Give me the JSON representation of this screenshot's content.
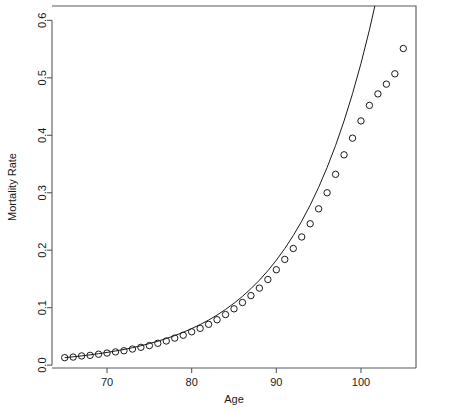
{
  "chart_data": {
    "type": "scatter",
    "title": "",
    "subtitle": "",
    "xlabel": "Age",
    "ylabel": "Mortality Rate",
    "xlim": [
      63.5,
      106.5
    ],
    "ylim": [
      -0.005,
      0.625
    ],
    "xticks": [
      70,
      80,
      90,
      100
    ],
    "xtick_labels": [
      "70",
      "80",
      "90",
      "100"
    ],
    "yticks": [
      0.0,
      0.1,
      0.2,
      0.3,
      0.4,
      0.5,
      0.6
    ],
    "ytick_labels": [
      "0.0",
      "0.1",
      "0.2",
      "0.3",
      "0.4",
      "0.5",
      "0.6"
    ],
    "grid": false,
    "legend": null,
    "box": "open-left-bottom",
    "series": [
      {
        "name": "Observed mortality rate",
        "type": "scatter",
        "marker": "open-circle",
        "marker_size": 3.2,
        "color": "#1a1a1a",
        "x": [
          65,
          66,
          67,
          68,
          69,
          70,
          71,
          72,
          73,
          74,
          75,
          76,
          77,
          78,
          79,
          80,
          81,
          82,
          83,
          84,
          85,
          86,
          87,
          88,
          89,
          90,
          91,
          92,
          93,
          94,
          95,
          96,
          97,
          98,
          99,
          100,
          101,
          102,
          103,
          104,
          105
        ],
        "y": [
          0.013,
          0.014,
          0.016,
          0.017,
          0.019,
          0.021,
          0.023,
          0.025,
          0.028,
          0.031,
          0.034,
          0.038,
          0.042,
          0.047,
          0.052,
          0.058,
          0.064,
          0.071,
          0.079,
          0.088,
          0.098,
          0.109,
          0.121,
          0.134,
          0.149,
          0.166,
          0.184,
          0.203,
          0.223,
          0.246,
          0.272,
          0.3,
          0.332,
          0.366,
          0.395,
          0.425,
          0.452,
          0.472,
          0.489,
          0.507,
          0.551
        ]
      },
      {
        "name": "Fitted Gompertz curve",
        "type": "line",
        "color": "#1a1a1a",
        "x": [
          65,
          66,
          67,
          68,
          69,
          70,
          71,
          72,
          73,
          74,
          75,
          76,
          77,
          78,
          79,
          80,
          81,
          82,
          83,
          84,
          85,
          86,
          87,
          88,
          89,
          90,
          91,
          92,
          93,
          94,
          95,
          96,
          97,
          98,
          99,
          100,
          101,
          102
        ],
        "y": [
          0.013,
          0.0145,
          0.0161,
          0.0179,
          0.0199,
          0.0221,
          0.0246,
          0.0273,
          0.0303,
          0.0337,
          0.0375,
          0.0416,
          0.0463,
          0.0514,
          0.0571,
          0.0635,
          0.0706,
          0.0784,
          0.0872,
          0.0969,
          0.1077,
          0.1197,
          0.133,
          0.1478,
          0.1643,
          0.1826,
          0.2029,
          0.2255,
          0.2506,
          0.2785,
          0.3095,
          0.344,
          0.3823,
          0.425,
          0.4723,
          0.525,
          0.5835,
          0.6485
        ]
      }
    ]
  },
  "axes": {
    "x_axis_name": "age-axis",
    "y_axis_name": "mortality-rate-axis"
  }
}
